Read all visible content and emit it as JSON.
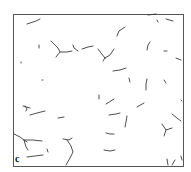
{
  "figure": {
    "panel_label": "c",
    "frame": {
      "x": 13,
      "y": 14,
      "width": 170,
      "height": 152,
      "stroke": "#555555"
    },
    "segment_color": "#3a3a3a",
    "segments": [
      "M27,24 L36,21 L40,19",
      "M39,45 L39,48",
      "M21,62 L21,63",
      "M42,80 L43,80",
      "M51,41 L58,48 L60,52 L67,52 L72,51",
      "M60,52 L56,57",
      "M73,45 L74,48 L78,51",
      "M82,49 L88,47 L93,46",
      "M98,49 L101,53 L105,58",
      "M105,58 L110,55 L114,49",
      "M105,58 L103,61",
      "M117,36 L119,31 L125,27",
      "M113,71 L120,70 L126,68",
      "M129,78 L130,82",
      "M147,50 L148,45 L150,42",
      "M147,79 L146,84 L146,90",
      "M164,51 L167,51",
      "M164,80 L166,83",
      "M176,58 L181,60",
      "M148,15 L156,14",
      "M157,20 L158,22",
      "M166,19 L173,21",
      "M99,95 L99,99",
      "M106,104 L114,99",
      "M137,107 L144,103",
      "M25,106 L27,109 L26,111",
      "M23,106 L30,108",
      "M30,115 L37,113 L45,111",
      "M58,118 L64,117",
      "M109,115 L116,114 L120,113",
      "M127,116 L126,122 L125,127",
      "M172,114 L177,118 L181,121",
      "M162,124 L166,130 L172,128",
      "M166,130 L164,136",
      "M106,133 L110,134 L114,134",
      "M14,134 L20,137 L24,140 L27,142",
      "M24,140 L33,140 L42,141",
      "M24,140 L26,147 L28,150",
      "M63,139 L69,140 L72,138",
      "M67,140 L71,146 L73,152 L70,158 L66,165",
      "M27,157 L35,156 L43,155",
      "M47,149 L48,152",
      "M104,150 L110,151 L115,150",
      "M167,159 L168,165",
      "M175,160 L172,165",
      "M181,156 L182,160",
      "M181,100 L182,101"
    ]
  }
}
